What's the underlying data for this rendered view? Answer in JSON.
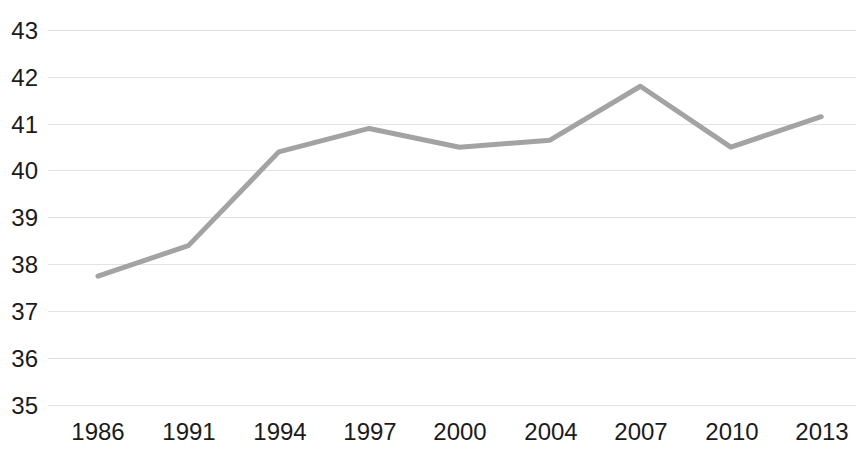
{
  "chart_data": {
    "type": "line",
    "title": "",
    "subtitle": "",
    "xlabel": "",
    "ylabel": "",
    "categories": [
      "1986",
      "1991",
      "1994",
      "1997",
      "2000",
      "2004",
      "2007",
      "2010",
      "2013"
    ],
    "x": [
      1986,
      1991,
      1994,
      1997,
      2000,
      2004,
      2007,
      2010,
      2013
    ],
    "values": [
      37.75,
      38.4,
      40.4,
      40.9,
      40.5,
      40.65,
      41.8,
      40.5,
      41.15
    ],
    "series": [
      {
        "name": "",
        "values": [
          37.75,
          38.4,
          40.4,
          40.9,
          40.5,
          40.65,
          41.8,
          40.5,
          41.15
        ],
        "color": "#a3a3a3"
      }
    ],
    "ylim": [
      35,
      43
    ],
    "yticks": [
      35,
      36,
      37,
      38,
      39,
      40,
      41,
      42,
      43
    ],
    "ytick_labels": [
      "35",
      "36",
      "37",
      "38",
      "39",
      "40",
      "41",
      "42",
      "43"
    ],
    "xtick_labels": [
      "1986",
      "1991",
      "1994",
      "1997",
      "2000",
      "2004",
      "2007",
      "2010",
      "2013"
    ],
    "grid": "horizontal",
    "grid_color": "#e3e3e3",
    "legend": "none",
    "annotations": [],
    "line_color": "#a3a3a3",
    "line_width": 5,
    "background": "#ffffff",
    "text_color": "#1b1b1b"
  }
}
